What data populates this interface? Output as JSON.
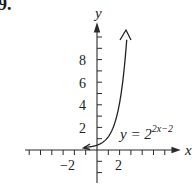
{
  "problem": {
    "number_fragment": "9."
  },
  "chart_data": {
    "type": "line",
    "title": "",
    "function": "y = 2^(2x-2)",
    "equation_label": {
      "base": "y = 2",
      "exponent": "2x−2"
    },
    "xlabel": "x",
    "ylabel": "y",
    "x_tick_labels": [
      "−2",
      "2"
    ],
    "y_tick_labels": [
      "2",
      "4",
      "6",
      "8"
    ],
    "xlim": [
      -6,
      7
    ],
    "ylim": [
      -3,
      11
    ],
    "x_ticks_every": 1,
    "y_ticks_every": 1,
    "grid": false,
    "series": [
      {
        "name": "y = 2^(2x-2)",
        "x": [
          -1.2,
          -1,
          -0.5,
          0,
          0.5,
          1,
          1.5,
          2,
          2.5,
          2.66
        ],
        "y": [
          0.06,
          0.0625,
          0.125,
          0.25,
          0.5,
          1,
          2,
          4,
          8,
          9.85
        ]
      }
    ],
    "annotations": [
      "y = 2^{2x-2}"
    ],
    "arrows": {
      "curve_ends": "both",
      "axes": "positive-direction"
    }
  },
  "axes": {
    "x_label": "x",
    "y_label": "y"
  },
  "labels": {
    "y_ticks": [
      {
        "text": "8"
      },
      {
        "text": "6"
      },
      {
        "text": "4"
      },
      {
        "text": "2"
      }
    ],
    "x_ticks": [
      {
        "text": "−2"
      },
      {
        "text": "2"
      }
    ],
    "equation_base": "y = 2",
    "equation_exp": "2x−2"
  }
}
